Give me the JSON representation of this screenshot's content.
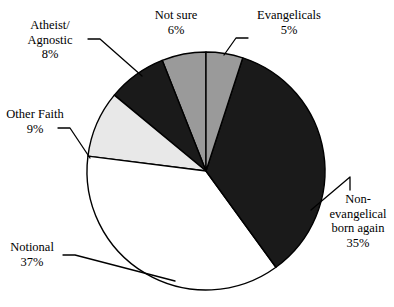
{
  "chart_data": {
    "type": "pie",
    "title": "",
    "xlabel": "",
    "ylabel": "",
    "legend_position": "none",
    "grid": false,
    "start_angle_deg": 0,
    "direction": "clockwise",
    "categories": [
      "Evangelicals",
      "Non-evangelical born again",
      "Notional",
      "Other Faith",
      "Atheist/Agnostic",
      "Not sure"
    ],
    "values": [
      5,
      35,
      37,
      9,
      8,
      6
    ],
    "value_labels": [
      "5%",
      "35%",
      "37%",
      "9%",
      "8%",
      "6%"
    ],
    "unit": "%",
    "total": 100,
    "colors": [
      "#9a9a9a",
      "#1a1a1a",
      "#ffffff",
      "#e8e8e8",
      "#1a1a1a",
      "#9a9a9a"
    ],
    "slice_outline_color": "#000000",
    "slices": [
      {
        "name": "Evangelicals",
        "value": 5,
        "value_label": "5%",
        "color": "#9a9a9a",
        "start_deg": 0,
        "end_deg": 18
      },
      {
        "name": "Non-evangelical born again",
        "value": 35,
        "value_label": "35%",
        "color": "#1a1a1a",
        "start_deg": 18,
        "end_deg": 144
      },
      {
        "name": "Notional",
        "value": 37,
        "value_label": "37%",
        "color": "#ffffff",
        "start_deg": 144,
        "end_deg": 277.2
      },
      {
        "name": "Other Faith",
        "value": 9,
        "value_label": "9%",
        "color": "#e8e8e8",
        "start_deg": 277.2,
        "end_deg": 309.6
      },
      {
        "name": "Atheist/Agnostic",
        "value": 8,
        "value_label": "8%",
        "color": "#1a1a1a",
        "start_deg": 309.6,
        "end_deg": 338.4
      },
      {
        "name": "Not sure",
        "value": 6,
        "value_label": "6%",
        "color": "#9a9a9a",
        "start_deg": 338.4,
        "end_deg": 360
      }
    ]
  },
  "labels": {
    "not_sure": {
      "name": "Not sure",
      "pct": "6%"
    },
    "evangelicals": {
      "name": "Evangelicals",
      "pct": "5%"
    },
    "atheist": {
      "line1": "Atheist/",
      "line2": "Agnostic",
      "pct": "8%"
    },
    "other_faith": {
      "name": "Other Faith",
      "pct": "9%"
    },
    "notional": {
      "name": "Notional",
      "pct": "37%"
    },
    "nonevangelical": {
      "line1": "Non-",
      "line2": "evangelical",
      "line3": "born again",
      "pct": "35%"
    }
  }
}
